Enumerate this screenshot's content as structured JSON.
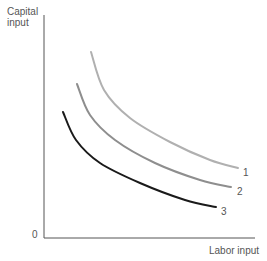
{
  "chart_data": {
    "type": "line",
    "title": "",
    "xlabel": "Labor input",
    "ylabel": "Capital input",
    "origin_label": "0",
    "grid": false,
    "legend": "inline labels at curve ends",
    "series": [
      {
        "name": "1",
        "color": "#b0b0b0",
        "points": [
          [
            91,
            52
          ],
          [
            104,
            90
          ],
          [
            130,
            118
          ],
          [
            170,
            142
          ],
          [
            210,
            160
          ],
          [
            238,
            168
          ]
        ]
      },
      {
        "name": "2",
        "color": "#8e8e8e",
        "points": [
          [
            77,
            84
          ],
          [
            90,
            115
          ],
          [
            115,
            140
          ],
          [
            155,
            163
          ],
          [
            200,
            180
          ],
          [
            231,
            187
          ]
        ]
      },
      {
        "name": "3",
        "color": "#1a1a1a",
        "points": [
          [
            63,
            112
          ],
          [
            76,
            140
          ],
          [
            100,
            163
          ],
          [
            140,
            183
          ],
          [
            185,
            200
          ],
          [
            216,
            207
          ]
        ]
      }
    ]
  },
  "labels": {
    "y_axis": [
      "Capital",
      "input"
    ],
    "x_axis": "Labor input",
    "origin": "0",
    "curve1": "1",
    "curve2": "2",
    "curve3": "3"
  }
}
